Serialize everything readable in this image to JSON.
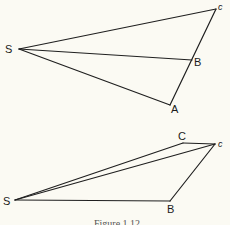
{
  "figure": {
    "caption": "Figure 1.12",
    "top_diagram": {
      "points": {
        "S": {
          "label": "S",
          "x": 19,
          "y": 49
        },
        "c": {
          "label": "c",
          "x": 216,
          "y": 9
        },
        "B": {
          "label": "B",
          "x": 192,
          "y": 60
        },
        "A": {
          "label": "A",
          "x": 170,
          "y": 105
        }
      },
      "segments": [
        [
          "S",
          "c"
        ],
        [
          "S",
          "B"
        ],
        [
          "S",
          "A"
        ],
        [
          "A",
          "c"
        ]
      ]
    },
    "bottom_diagram": {
      "points": {
        "S": {
          "label": "S",
          "x": 15,
          "y": 200
        },
        "C": {
          "label": "C",
          "x": 183,
          "y": 143
        },
        "c": {
          "label": "c",
          "x": 215,
          "y": 144
        },
        "B": {
          "label": "B",
          "x": 170,
          "y": 201
        }
      },
      "segments": [
        [
          "S",
          "C"
        ],
        [
          "S",
          "c"
        ],
        [
          "C",
          "c"
        ],
        [
          "S",
          "B"
        ],
        [
          "B",
          "c"
        ]
      ]
    }
  }
}
